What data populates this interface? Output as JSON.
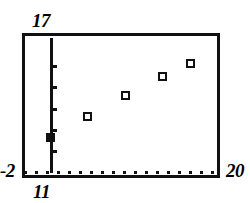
{
  "window": {
    "ymax_label": "17",
    "ymin_label": "-2",
    "xmin_label": "11",
    "xmax_label": "20"
  },
  "axes": {
    "y_axis_name": "y-axis",
    "x_axis_name": "x-axis",
    "x_axis_style": "dotted",
    "y_axis_style": "solid-with-ticks",
    "y_tick_count": 5
  },
  "colors": {
    "ink": "#111111",
    "background": "#ffffff"
  },
  "chart_data": {
    "type": "scatter",
    "title": "",
    "subtitle": "",
    "xlabel": "",
    "ylabel": "",
    "xlim": [
      11,
      20
    ],
    "ylim": [
      -2,
      17
    ],
    "grid": false,
    "legend": null,
    "x": [
      11,
      13,
      15,
      17,
      18.5
    ],
    "y": [
      2.9,
      5.9,
      8.8,
      11.5,
      13.4
    ],
    "point_style": [
      "filled-square",
      "open-square",
      "open-square",
      "open-square",
      "open-square"
    ],
    "annotations": [],
    "xticks": [],
    "yticks": [
      1,
      4,
      7,
      10,
      13
    ],
    "series": [
      {
        "name": "data",
        "values": [
          2.9,
          5.9,
          8.8,
          11.5,
          13.4
        ]
      }
    ]
  }
}
